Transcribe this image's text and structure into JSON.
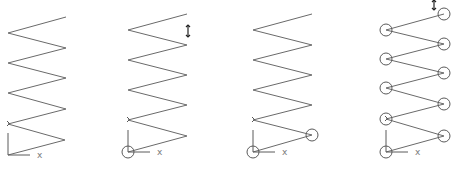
{
  "figure": {
    "panels": [
      {
        "id": "panel-1",
        "origin": [
          8,
          155
        ],
        "axis_label": "x",
        "vertices": [
          [
            66,
            17
          ],
          [
            8,
            33
          ],
          [
            66,
            48
          ],
          [
            8,
            63
          ],
          [
            66,
            78
          ],
          [
            8,
            93
          ],
          [
            66,
            109
          ],
          [
            8,
            124
          ],
          [
            65,
            140
          ],
          [
            8,
            155
          ]
        ],
        "circled": [],
        "arrow": null
      },
      {
        "id": "panel-2",
        "origin": [
          128,
          152
        ],
        "axis_label": "x",
        "vertices": [
          [
            187,
            14
          ],
          [
            128,
            30
          ],
          [
            187,
            45
          ],
          [
            128,
            60
          ],
          [
            187,
            75
          ],
          [
            128,
            90
          ],
          [
            187,
            105
          ],
          [
            128,
            120
          ],
          [
            187,
            136
          ],
          [
            128,
            152
          ]
        ],
        "circled": [
          9
        ],
        "arrow": {
          "x": 188,
          "y1": 25,
          "y2": 37
        }
      },
      {
        "id": "panel-3",
        "origin": [
          253,
          152
        ],
        "axis_label": "x",
        "vertices": [
          [
            312,
            14
          ],
          [
            253,
            30
          ],
          [
            312,
            45
          ],
          [
            253,
            60
          ],
          [
            312,
            75
          ],
          [
            253,
            90
          ],
          [
            312,
            105
          ],
          [
            253,
            120
          ],
          [
            312,
            135
          ],
          [
            253,
            152
          ]
        ],
        "circled": [
          8,
          9
        ],
        "arrow": null
      },
      {
        "id": "panel-4",
        "origin": [
          386,
          152
        ],
        "axis_label": "x",
        "vertices": [
          [
            444,
            14
          ],
          [
            386,
            30
          ],
          [
            444,
            44
          ],
          [
            386,
            59
          ],
          [
            444,
            73
          ],
          [
            386,
            88
          ],
          [
            444,
            104
          ],
          [
            386,
            119
          ],
          [
            444,
            136
          ],
          [
            386,
            152
          ]
        ],
        "circled": [
          0,
          1,
          2,
          3,
          4,
          5,
          6,
          7,
          8,
          9
        ],
        "arrow": {
          "x": 434,
          "y1": 0,
          "y2": 10
        }
      }
    ]
  }
}
